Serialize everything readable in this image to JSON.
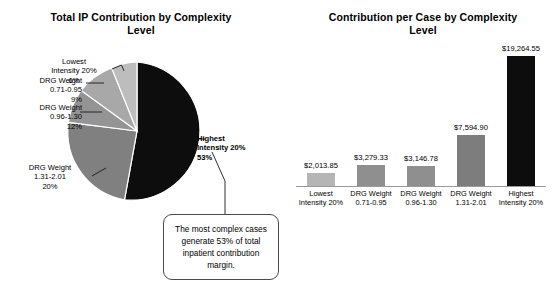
{
  "pie_chart": {
    "title": "Total IP Contribution by\nComplexity Level",
    "labels": {
      "lowest": "Lowest\nIntensity 20%\n6%",
      "dw071": "DRG Weight\n0.71-0.95\n9%",
      "dw096": "DRG Weight\n0.96-1.30\n12%",
      "dw131": "DRG Weight\n1.31-2.01\n20%",
      "highest": "Highest\nIntensity 20%\n53%"
    }
  },
  "callout": {
    "text": "The most complex cases generate 53% of total inpatient contribution margin."
  },
  "bar_chart": {
    "title": "Contribution per Case by\nComplexity Level"
  },
  "chart_data": [
    {
      "type": "pie",
      "title": "Total IP Contribution by Complexity Level",
      "categories": [
        "Highest Intensity 20%",
        "DRG Weight 1.31-2.01",
        "DRG Weight 0.96-1.30",
        "DRG Weight 0.71-0.95",
        "Lowest Intensity 20%"
      ],
      "values": [
        53,
        20,
        12,
        9,
        6
      ],
      "value_labels": [
        "53%",
        "20%",
        "12%",
        "9%",
        "6%"
      ],
      "unit": "percent",
      "colors": [
        "#0d0d0d",
        "#808080",
        "#949494",
        "#a8a8a8",
        "#bdbdbd"
      ],
      "legend": "none",
      "annotations": [
        "The most complex cases generate 53% of total inpatient contribution margin."
      ]
    },
    {
      "type": "bar",
      "title": "Contribution per Case by Complexity Level",
      "xlabel": "",
      "ylabel": "",
      "categories": [
        "Lowest\nIntensity 20%",
        "DRG Weight\n0.71-0.95",
        "DRG Weight\n0.96-1.30",
        "DRG Weight\n1.31-2.01",
        "Highest\nIntensity 20%"
      ],
      "values": [
        2013.85,
        3279.33,
        3146.78,
        7594.9,
        19264.55
      ],
      "data_labels": [
        "$2,013.85",
        "$3,279.33",
        "$3,146.78",
        "$7,594.90",
        "$19,264.55"
      ],
      "ylim": [
        0,
        19264.55
      ],
      "grid": false,
      "legend": "none",
      "bar_colors": [
        "#b5b5b5",
        "#8f8f8f",
        "#8f8f8f",
        "#7d7d7d",
        "#0d0d0d"
      ]
    }
  ]
}
